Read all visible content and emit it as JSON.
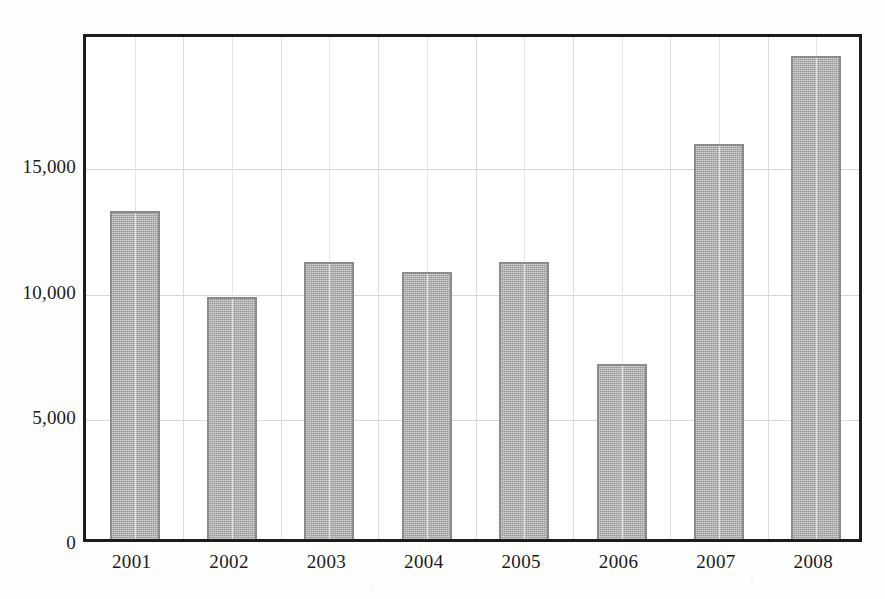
{
  "chart_data": {
    "type": "bar",
    "title": "",
    "subtitle": "",
    "xlabel": "",
    "ylabel": "",
    "categories": [
      "2001",
      "2002",
      "2003",
      "2004",
      "2005",
      "2006",
      "2007",
      "2008"
    ],
    "values": [
      13100,
      9650,
      11050,
      10650,
      11050,
      7000,
      15750,
      19300
    ],
    "series": [
      {
        "name": "",
        "values": [
          13100,
          9650,
          11050,
          10650,
          11050,
          7000,
          15750,
          19300
        ]
      }
    ],
    "ylim": [
      0,
      20280
    ],
    "yticks": [
      0,
      5000,
      10000,
      15000
    ],
    "ytick_labels": [
      "0",
      "5,000",
      "10,000",
      "15,000"
    ],
    "grid": {
      "horizontal": true,
      "vertical": true
    },
    "legend": {
      "visible": false,
      "position": "none",
      "entries": []
    },
    "annotations": [],
    "colors": {
      "bar_fill": "#a8a8a8",
      "bar_border": "#8b8b8b",
      "axis": "#1c1c1c",
      "gridline": "#d8d8d8",
      "text": "#1b1b1b",
      "background": "#fdfdfc",
      "plot_background": "#ffffff"
    }
  }
}
